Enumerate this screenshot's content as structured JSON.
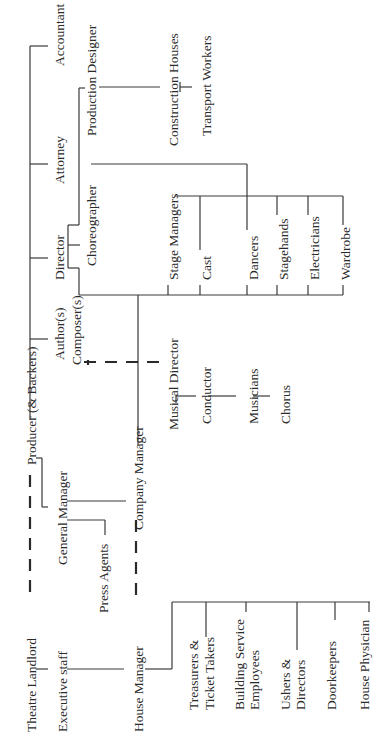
{
  "orientation": "rotated-counterclockwise",
  "nodes": {
    "producer": "Producer (& Backers)",
    "theatre_landlord": "Theatre Landlord",
    "executive_staff": "Executive staff",
    "general_manager": "General Manager",
    "press_agents": "Press Agents",
    "house_manager": "House Manager",
    "company_manager": "Company Manager",
    "authors": "Author(s)",
    "composers": "Composer(s)",
    "director": "Director",
    "attorney": "Attorney",
    "accountant": "Accountant",
    "choreographer": "Choreographer",
    "production_designer": "Production Designer",
    "construction_houses": "Construction Houses",
    "transport_workers": "Transport Workers",
    "musical_director": "Musical Director",
    "conductor": "Conductor",
    "musicians": "Musicians",
    "chorus": "Chorus",
    "stage_managers": "Stage Managers",
    "cast": "Cast",
    "dancers": "Dancers",
    "stagehands": "Stagehands",
    "electricians": "Electricians",
    "wardrobe": "Wardrobe",
    "treasurers_1": "Treasurers &",
    "treasurers_2": "Ticket Takers",
    "building_service_1": "Building Service",
    "building_service_2": "Employees",
    "ushers_1": "Ushers &",
    "ushers_2": "Directors",
    "doorkeepers": "Doorkeepers",
    "house_physician": "House Physician"
  },
  "relations": [
    {
      "from": "Producer (& Backers)",
      "to": "Author(s) / Composer(s)",
      "style": "solid"
    },
    {
      "from": "Producer (& Backers)",
      "to": "Director",
      "style": "solid"
    },
    {
      "from": "Producer (& Backers)",
      "to": "Attorney",
      "style": "solid"
    },
    {
      "from": "Producer (& Backers)",
      "to": "Accountant",
      "style": "solid"
    },
    {
      "from": "Producer (& Backers)",
      "to": "General Manager",
      "style": "solid"
    },
    {
      "from": "Producer (& Backers)",
      "to": "Theatre Landlord",
      "style": "dashed"
    },
    {
      "from": "Theatre Landlord",
      "to": "Executive staff",
      "style": "solid"
    },
    {
      "from": "Executive staff",
      "to": "House Manager",
      "style": "solid"
    },
    {
      "from": "General Manager",
      "to": "Company Manager",
      "style": "solid"
    },
    {
      "from": "General Manager",
      "to": "Press Agents",
      "style": "solid"
    },
    {
      "from": "House Manager",
      "to": "Company Manager",
      "style": "dashed"
    },
    {
      "from": "Composer(s)",
      "to": "Musical Director",
      "style": "dashed"
    },
    {
      "from": "Director",
      "to": "Choreographer",
      "style": "solid"
    },
    {
      "from": "Director",
      "to": "Production Designer",
      "style": "solid"
    },
    {
      "from": "Production Designer",
      "to": "Construction Houses",
      "style": "solid"
    },
    {
      "from": "Construction Houses",
      "to": "Transport Workers",
      "style": "solid"
    },
    {
      "from": "Choreographer",
      "to": "Dancers",
      "style": "solid"
    },
    {
      "from": "Company Manager",
      "to": "Stage crew",
      "style": "solid"
    },
    {
      "from": "Musical Director",
      "to": "Conductor",
      "style": "solid"
    },
    {
      "from": "Conductor",
      "to": "Musicians",
      "style": "solid"
    },
    {
      "from": "Musicians",
      "to": "Chorus",
      "style": "solid"
    },
    {
      "from": "House Manager",
      "to": "Front of house staff",
      "style": "solid"
    }
  ]
}
